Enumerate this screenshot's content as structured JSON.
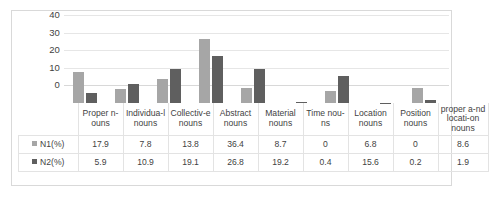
{
  "chart_data": {
    "type": "bar",
    "title": "",
    "xlabel": "",
    "ylabel": "",
    "ylim": [
      0,
      40
    ],
    "yticks": [
      0,
      10,
      20,
      30,
      40
    ],
    "grid": true,
    "legend_position": "table-row-labels",
    "categories": [
      "Proper n-ouns",
      "Individua-l nouns",
      "Collectiv-e nouns",
      "Abstract nouns",
      "Material nouns",
      "Time nou-ns",
      "Location nouns",
      "Position nouns",
      "proper a-nd locati-on nouns"
    ],
    "series": [
      {
        "name": "N1(%)",
        "color": "#a6a6a6",
        "values": [
          17.9,
          7.8,
          13.8,
          36.4,
          8.7,
          0,
          6.8,
          0,
          8.6
        ]
      },
      {
        "name": "N2(%)",
        "color": "#5f5f5f",
        "values": [
          5.9,
          10.9,
          19.1,
          26.8,
          19.2,
          0.4,
          15.6,
          0.2,
          1.9
        ]
      }
    ]
  },
  "table": {
    "corner_label": "",
    "headers": [
      "Proper n-ouns",
      "Individua-l nouns",
      "Collectiv-e nouns",
      "Abstract nouns",
      "Material nouns",
      "Time nou-ns",
      "Location nouns",
      "Position nouns",
      "proper a-nd locati-on nouns"
    ],
    "rows": [
      {
        "label": "N1(%)",
        "swatch": "legend-swatch-light",
        "values": [
          "17.9",
          "7.8",
          "13.8",
          "36.4",
          "8.7",
          "0",
          "6.8",
          "0",
          "8.6"
        ]
      },
      {
        "label": "N2(%)",
        "swatch": "legend-swatch-dark",
        "values": [
          "5.9",
          "10.9",
          "19.1",
          "26.8",
          "19.2",
          "0.4",
          "15.6",
          "0.2",
          "1.9"
        ]
      }
    ]
  },
  "axis": {
    "tick_labels": [
      "40",
      "30",
      "20",
      "10",
      "0"
    ]
  },
  "colors": {
    "series1": "#a6a6a6",
    "series2": "#5f5f5f",
    "gridline": "#e6e6e6",
    "frame": "#d9d9d9",
    "text": "#3f3f3f"
  }
}
